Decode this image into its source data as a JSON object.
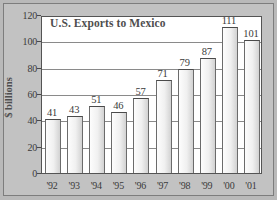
{
  "chart_data": {
    "type": "bar",
    "title": "U.S. Exports to Mexico",
    "xlabel": "",
    "ylabel": "$ billions",
    "categories": [
      "'92",
      "'93",
      "'94",
      "'95",
      "'96",
      "'97",
      "'98",
      "'99",
      "'00",
      "'01"
    ],
    "values": [
      41,
      43,
      51,
      46,
      57,
      71,
      79,
      87,
      111,
      101
    ],
    "value_labels": [
      "41",
      "43",
      "51",
      "46",
      "57",
      "71",
      "79",
      "87",
      "111",
      "101"
    ],
    "ylim": [
      0,
      120
    ],
    "ytick_values": [
      0,
      20,
      40,
      60,
      80,
      100,
      120
    ],
    "ytick_labels": [
      "0",
      "20",
      "40",
      "60",
      "80",
      "100",
      "120"
    ],
    "grid": "horizontal",
    "legend": "none",
    "colors": {
      "bar_fill": "#f0f0f0",
      "bar_edge": "#6b6b6b",
      "plot_background": "#ffffff",
      "figure_background": "#c2c2c2",
      "text": "#3a3a3a",
      "title_text": "#4e4e4e",
      "gridline": "#8a8a8a"
    }
  }
}
